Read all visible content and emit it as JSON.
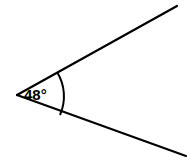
{
  "diagram": {
    "type": "angle",
    "angle_label": "48°",
    "angle_degrees": 48,
    "colors": {
      "line": "#000000",
      "background": "#ffffff"
    },
    "vertex": [
      17,
      95
    ],
    "ray_top_end": [
      177,
      6
    ],
    "ray_bottom_end": [
      186,
      156
    ]
  }
}
